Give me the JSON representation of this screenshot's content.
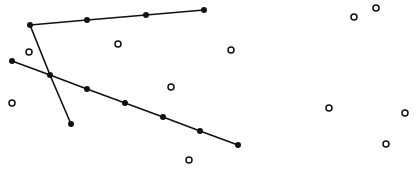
{
  "diagram": {
    "width": 417,
    "height": 175,
    "background": "#ffffff",
    "stroke_color": "#111111",
    "polylines": [
      {
        "name": "polyline-top",
        "points": [
          [
            30,
            25
          ],
          [
            87,
            20
          ],
          [
            146,
            15
          ],
          [
            204,
            10
          ]
        ]
      },
      {
        "name": "polyline-diagonal",
        "points": [
          [
            30,
            25
          ],
          [
            50,
            75
          ],
          [
            71,
            124
          ]
        ]
      },
      {
        "name": "polyline-long",
        "points": [
          [
            12,
            61
          ],
          [
            50,
            75
          ],
          [
            87,
            89
          ],
          [
            125,
            103
          ],
          [
            163,
            117
          ],
          [
            200,
            131
          ],
          [
            238,
            145
          ]
        ]
      }
    ],
    "filled_points": [
      [
        30,
        25
      ],
      [
        87,
        20
      ],
      [
        146,
        15
      ],
      [
        204,
        10
      ],
      [
        12,
        61
      ],
      [
        50,
        75
      ],
      [
        71,
        124
      ],
      [
        87,
        89
      ],
      [
        125,
        103
      ],
      [
        163,
        117
      ],
      [
        200,
        131
      ],
      [
        238,
        145
      ]
    ],
    "open_points": [
      [
        29,
        52
      ],
      [
        118,
        44
      ],
      [
        231,
        50
      ],
      [
        171,
        87
      ],
      [
        12,
        103
      ],
      [
        189,
        160
      ],
      [
        354,
        17
      ],
      [
        376,
        8
      ],
      [
        329,
        108
      ],
      [
        405,
        113
      ],
      [
        386,
        144
      ]
    ]
  }
}
